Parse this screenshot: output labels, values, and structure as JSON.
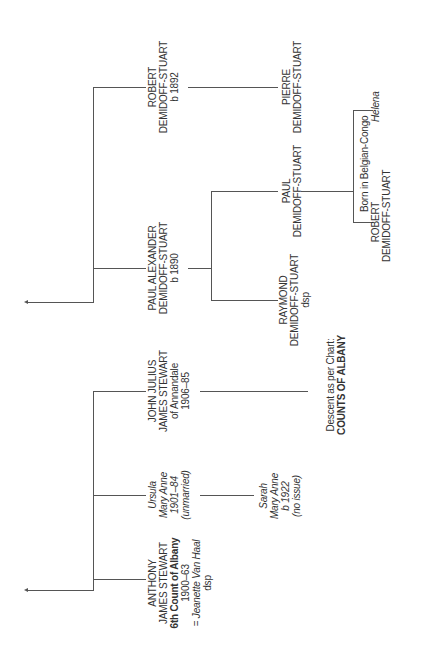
{
  "people": {
    "robert_1892": {
      "line1": "ROBERT",
      "line2": "DEMIDOFF-STUART",
      "line3": "b 1892"
    },
    "paul_alexander": {
      "line1": "PAUL ALEXANDER",
      "line2": "DEMIDOFF-STUART",
      "line3": "b 1890"
    },
    "pierre": {
      "line1": "PIERRE",
      "line2": "DEMIDOFF-STUART"
    },
    "paul": {
      "line1": "PAUL",
      "line2": "DEMIDOFF-STUART"
    },
    "raymond": {
      "line1": "RAYMOND",
      "line2": "DEMIDOFF-STUART",
      "line3": "dsp"
    },
    "robert_congo": {
      "line1": "ROBERT",
      "line2": "DEMIDOFF-STUART"
    },
    "helena": {
      "line1": "Helena"
    },
    "anthony": {
      "line1": "ANTHONY",
      "line2": "JAMES STEWART",
      "line3": "6th Count of Albany",
      "line4": "1900–63",
      "line5": "= Jeanette Van Haal",
      "line6": "dsp"
    },
    "ursula": {
      "line1": "Ursula",
      "line2": "Mary Anne",
      "line3": "1901–84",
      "line4": "(unmarried)"
    },
    "john_julius": {
      "line1": "JOHN JULIUS",
      "line2": "JAMES STEWART",
      "line3": "of Annandale",
      "line4": "1906–85"
    },
    "sarah": {
      "line1": "Sarah",
      "line2": "Mary Anne",
      "line3": "b 1922",
      "line4": "(no issue)"
    }
  },
  "notes": {
    "congo": "Born in Belgian-Congo",
    "descent_line1": "Descent as per Chart:",
    "descent_line2": "COUNTS OF ALBANY"
  }
}
